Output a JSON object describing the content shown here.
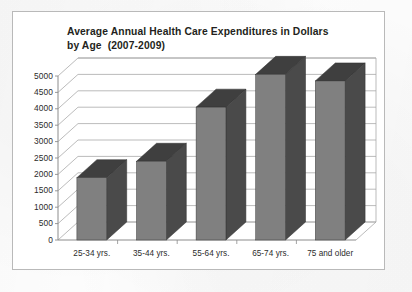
{
  "chart_data": {
    "type": "bar",
    "title": "Average Annual Health Care Expenditures in Dollars by Age  (2007-2009)",
    "title_lines": [
      "Average Annual Health Care Expenditures in Dollars",
      "by Age  (2007-2009)"
    ],
    "categories": [
      "25-34 yrs.",
      "35-44 yrs.",
      "55-64 yrs.",
      "65-74 yrs.",
      "75 and older"
    ],
    "values": [
      1900,
      2400,
      4050,
      5050,
      4850
    ],
    "xlabel": "",
    "ylabel": "",
    "ylim": [
      0,
      5000
    ],
    "ystep": 500,
    "ytick_labels": [
      "5000",
      "4500",
      "4000",
      "3500",
      "3000",
      "2500",
      "2000",
      "1500",
      "1000",
      "500",
      "0"
    ],
    "grid": true,
    "legend": false,
    "style": "3d-column",
    "colors": {
      "bar_front": "#808080",
      "bar_side": "#4a4a4a",
      "bar_top": "#3f3f3f",
      "gridline": "#a9a9a9",
      "axis": "#8c8c8c",
      "frame": "#b9b9b9",
      "text": "#231f20",
      "background": "#ffffff"
    }
  }
}
